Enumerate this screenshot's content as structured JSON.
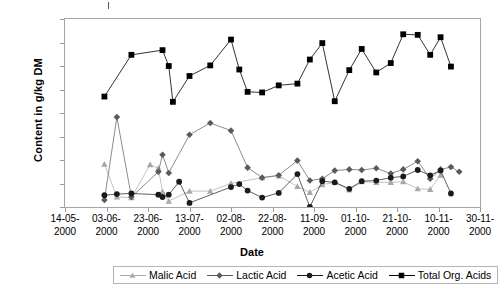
{
  "axis": {
    "ylabel": "Content in g/kg DM",
    "xlabel": "Date"
  },
  "chart_data": {
    "type": "line",
    "title": "",
    "xlabel": "Date",
    "ylabel": "Content in g/kg DM",
    "ylim": [
      0,
      160
    ],
    "ytick_labels": [
      "0,0",
      "20,0",
      "40,0",
      "60,0",
      "80,0",
      "100,0",
      "120,0",
      "140,0",
      "160,0"
    ],
    "ytick_values": [
      0,
      20,
      40,
      60,
      80,
      100,
      120,
      140,
      160
    ],
    "xtick_labels": [
      "14-05-2000",
      "03-06-2000",
      "23-06-2000",
      "13-07-2000",
      "02-08-2000",
      "22-08-2000",
      "11-09-2000",
      "01-10-2000",
      "21-10-2000",
      "10-11-2000",
      "30-11-2000"
    ],
    "xtick_days": [
      0,
      20,
      40,
      60,
      80,
      100,
      120,
      140,
      160,
      180,
      200
    ],
    "xlim_days": [
      0,
      200
    ],
    "grid": false,
    "legend_position": "bottom",
    "series": [
      {
        "name": "Malic Acid",
        "color": "#a8a8a8",
        "marker": "triangle",
        "points": [
          {
            "x": 19,
            "y": 36.5
          },
          {
            "x": 25,
            "y": 8.5
          },
          {
            "x": 32,
            "y": 8.0
          },
          {
            "x": 41,
            "y": 36.0
          },
          {
            "x": 45,
            "y": 33.0
          },
          {
            "x": 47,
            "y": 13.0
          },
          {
            "x": 50,
            "y": 5.0
          },
          {
            "x": 60,
            "y": 13.5
          },
          {
            "x": 70,
            "y": 13.5
          },
          {
            "x": 80,
            "y": 20.0
          },
          {
            "x": 95,
            "y": 25.0
          },
          {
            "x": 103,
            "y": 26.5
          },
          {
            "x": 112,
            "y": 17.5
          },
          {
            "x": 118,
            "y": 12.5
          },
          {
            "x": 124,
            "y": 19.0
          },
          {
            "x": 130,
            "y": 21.0
          },
          {
            "x": 137,
            "y": 14.5
          },
          {
            "x": 143,
            "y": 21.5
          },
          {
            "x": 150,
            "y": 21.0
          },
          {
            "x": 157,
            "y": 21.0
          },
          {
            "x": 163,
            "y": 21.5
          },
          {
            "x": 170,
            "y": 15.5
          },
          {
            "x": 176,
            "y": 15.0
          },
          {
            "x": 181,
            "y": 27.0
          }
        ]
      },
      {
        "name": "Lactic Acid",
        "color": "#5a5a5a",
        "marker": "diamond",
        "points": [
          {
            "x": 19,
            "y": 6.0
          },
          {
            "x": 25,
            "y": 76.5
          },
          {
            "x": 32,
            "y": 8.5
          },
          {
            "x": 45,
            "y": 30.0
          },
          {
            "x": 47,
            "y": 44.5
          },
          {
            "x": 50,
            "y": 29.0
          },
          {
            "x": 60,
            "y": 61.5
          },
          {
            "x": 70,
            "y": 71.5
          },
          {
            "x": 80,
            "y": 65.0
          },
          {
            "x": 88,
            "y": 33.5
          },
          {
            "x": 95,
            "y": 25.0
          },
          {
            "x": 103,
            "y": 27.0
          },
          {
            "x": 112,
            "y": 39.5
          },
          {
            "x": 118,
            "y": 22.5
          },
          {
            "x": 124,
            "y": 24.0
          },
          {
            "x": 130,
            "y": 31.0
          },
          {
            "x": 137,
            "y": 32.0
          },
          {
            "x": 143,
            "y": 31.5
          },
          {
            "x": 150,
            "y": 33.0
          },
          {
            "x": 157,
            "y": 28.5
          },
          {
            "x": 163,
            "y": 32.0
          },
          {
            "x": 170,
            "y": 39.0
          },
          {
            "x": 176,
            "y": 24.0
          },
          {
            "x": 181,
            "y": 32.0
          },
          {
            "x": 186,
            "y": 34.0
          },
          {
            "x": 190,
            "y": 30.0
          }
        ]
      },
      {
        "name": "Acetic Acid",
        "color": "#1a1a1a",
        "marker": "circle",
        "points": [
          {
            "x": 19,
            "y": 10.0
          },
          {
            "x": 25,
            "y": 11.0
          },
          {
            "x": 32,
            "y": 11.5
          },
          {
            "x": 45,
            "y": 10.5
          },
          {
            "x": 47,
            "y": 8.5
          },
          {
            "x": 50,
            "y": 10.5
          },
          {
            "x": 55,
            "y": 21.5
          },
          {
            "x": 60,
            "y": 3.5
          },
          {
            "x": 80,
            "y": 17.0
          },
          {
            "x": 84,
            "y": 19.5
          },
          {
            "x": 88,
            "y": 14.0
          },
          {
            "x": 95,
            "y": 8.0
          },
          {
            "x": 103,
            "y": 12.0
          },
          {
            "x": 112,
            "y": 28.0
          },
          {
            "x": 118,
            "y": 0.0
          },
          {
            "x": 124,
            "y": 22.0
          },
          {
            "x": 130,
            "y": 21.0
          },
          {
            "x": 137,
            "y": 15.5
          },
          {
            "x": 143,
            "y": 22.0
          },
          {
            "x": 150,
            "y": 22.5
          },
          {
            "x": 157,
            "y": 25.0
          },
          {
            "x": 163,
            "y": 26.0
          },
          {
            "x": 170,
            "y": 31.5
          },
          {
            "x": 176,
            "y": 27.0
          },
          {
            "x": 181,
            "y": 31.0
          },
          {
            "x": 186,
            "y": 11.5
          }
        ]
      },
      {
        "name": "Total Org. Acids",
        "color": "#000000",
        "marker": "square",
        "points": [
          {
            "x": 19,
            "y": 94.0
          },
          {
            "x": 32,
            "y": 129.5
          },
          {
            "x": 47,
            "y": 133.5
          },
          {
            "x": 50,
            "y": 120.0
          },
          {
            "x": 52,
            "y": 89.5
          },
          {
            "x": 60,
            "y": 111.5
          },
          {
            "x": 70,
            "y": 120.5
          },
          {
            "x": 80,
            "y": 142.5
          },
          {
            "x": 84,
            "y": 117.0
          },
          {
            "x": 88,
            "y": 98.0
          },
          {
            "x": 95,
            "y": 97.5
          },
          {
            "x": 103,
            "y": 103.5
          },
          {
            "x": 112,
            "y": 105.0
          },
          {
            "x": 118,
            "y": 125.5
          },
          {
            "x": 124,
            "y": 139.5
          },
          {
            "x": 130,
            "y": 90.0
          },
          {
            "x": 137,
            "y": 116.5
          },
          {
            "x": 143,
            "y": 134.5
          },
          {
            "x": 150,
            "y": 114.5
          },
          {
            "x": 157,
            "y": 122.5
          },
          {
            "x": 163,
            "y": 147.0
          },
          {
            "x": 170,
            "y": 146.5
          },
          {
            "x": 176,
            "y": 129.5
          },
          {
            "x": 181,
            "y": 144.5
          },
          {
            "x": 186,
            "y": 119.5
          }
        ]
      }
    ]
  },
  "legend": {
    "items": [
      {
        "label": "Malic Acid"
      },
      {
        "label": "Lactic Acid"
      },
      {
        "label": "Acetic Acid"
      },
      {
        "label": "Total Org. Acids"
      }
    ]
  }
}
